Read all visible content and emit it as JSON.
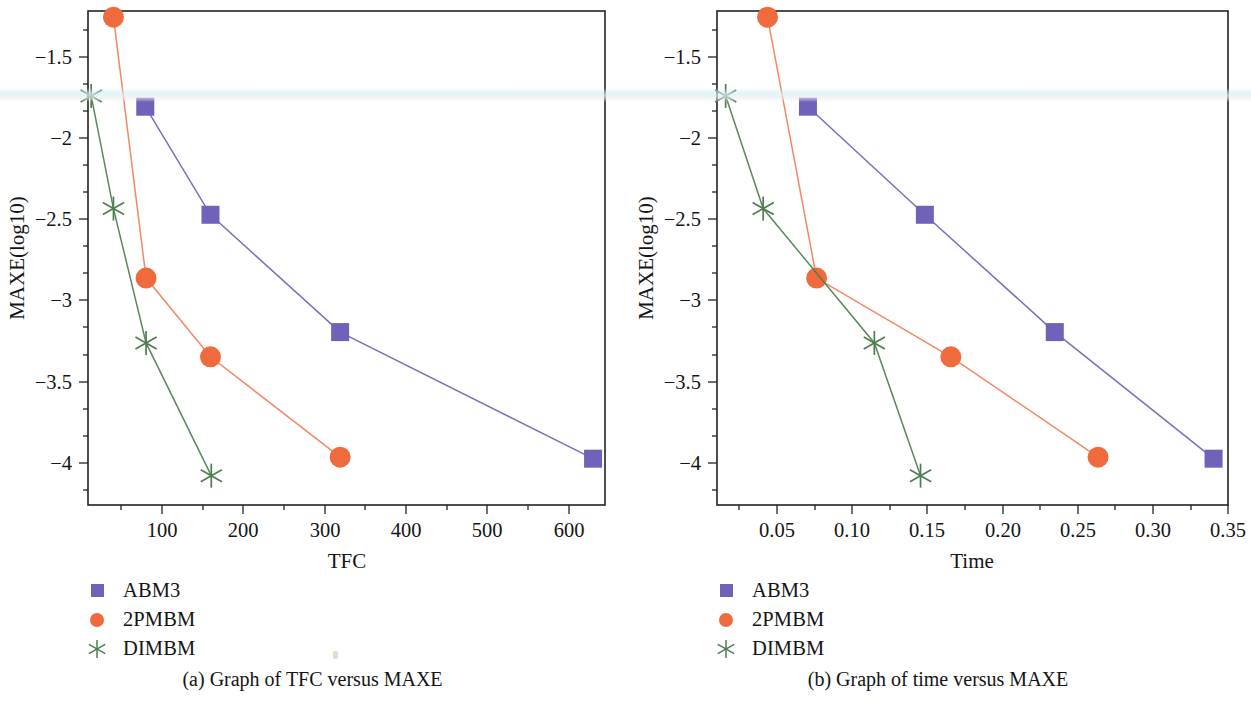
{
  "figure": {
    "panels": [
      {
        "id": "a",
        "caption_index": "(a)",
        "caption_text": "Graph of TFC versus MAXE",
        "xlabel": "TFC",
        "ylabel": "MAXE(log10)",
        "xticks": [
          "100",
          "200",
          "300",
          "400",
          "500",
          "600"
        ],
        "yticks": [
          "−1.5",
          "−2",
          "−2.5",
          "−3",
          "−3.5",
          "−4"
        ],
        "legend": [
          {
            "label": "ABM3",
            "marker": "square-marker",
            "color": "#6f62b8"
          },
          {
            "label": "2PMBM",
            "marker": "circle-marker",
            "color": "#ef6a3c"
          },
          {
            "label": "DIMBM",
            "marker": "star-marker",
            "color": "#4e7d50"
          }
        ]
      },
      {
        "id": "b",
        "caption_index": "(b)",
        "caption_text": "Graph of time versus MAXE",
        "xlabel": "Time",
        "ylabel": "MAXE(log10)",
        "xticks": [
          "0.05",
          "0.10",
          "0.15",
          "0.20",
          "0.25",
          "0.30",
          "0.35"
        ],
        "yticks": [
          "−1.5",
          "−2",
          "−2.5",
          "−3",
          "−3.5",
          "−4"
        ],
        "legend": [
          {
            "label": "ABM3",
            "marker": "square-marker",
            "color": "#6f62b8"
          },
          {
            "label": "2PMBM",
            "marker": "circle-marker",
            "color": "#ef6a3c"
          },
          {
            "label": "DIMBM",
            "marker": "star-marker",
            "color": "#4e7d50"
          }
        ]
      }
    ]
  },
  "chart_data": [
    {
      "type": "line",
      "title": "(a) Graph of TFC versus MAXE",
      "xlabel": "TFC",
      "ylabel": "MAXE(log10)",
      "xlim": [
        10,
        660
      ],
      "ylim": [
        -4.38,
        -1.18
      ],
      "xticks": [
        100,
        200,
        300,
        400,
        500,
        600
      ],
      "yticks": [
        -1.5,
        -2,
        -2.5,
        -3,
        -3.5,
        -4
      ],
      "grid": false,
      "legend_position": "below-left",
      "series": [
        {
          "name": "ABM3",
          "color": "#6f62b8",
          "marker": "square",
          "x": [
            82,
            164,
            327,
            645
          ],
          "y": [
            -1.8,
            -2.5,
            -3.26,
            -4.08
          ]
        },
        {
          "name": "2PMBM",
          "color": "#ef6a3c",
          "marker": "circle",
          "x": [
            42,
            83,
            164,
            327
          ],
          "y": [
            -1.22,
            -2.91,
            -3.42,
            -4.07
          ]
        },
        {
          "name": "DIMBM",
          "color": "#4e7d50",
          "marker": "star",
          "x": [
            14,
            42,
            83,
            165
          ],
          "y": [
            -1.73,
            -2.46,
            -3.33,
            -4.19
          ]
        }
      ]
    },
    {
      "type": "line",
      "title": "(b) Graph of time versus MAXE",
      "xlabel": "Time",
      "ylabel": "MAXE(log10)",
      "xlim": [
        0.008,
        0.362
      ],
      "ylim": [
        -4.38,
        -1.18
      ],
      "xticks": [
        0.05,
        0.1,
        0.15,
        0.2,
        0.25,
        0.3,
        0.35
      ],
      "yticks": [
        -1.5,
        -2,
        -2.5,
        -3,
        -3.5,
        -4
      ],
      "grid": false,
      "legend_position": "below-left",
      "series": [
        {
          "name": "ABM3",
          "color": "#6f62b8",
          "marker": "square",
          "x": [
            0.071,
            0.152,
            0.242,
            0.352
          ],
          "y": [
            -1.8,
            -2.5,
            -3.26,
            -4.08
          ]
        },
        {
          "name": "2PMBM",
          "color": "#ef6a3c",
          "marker": "circle",
          "x": [
            0.043,
            0.077,
            0.17,
            0.272
          ],
          "y": [
            -1.22,
            -2.91,
            -3.42,
            -4.07
          ]
        },
        {
          "name": "DIMBM",
          "color": "#4e7d50",
          "marker": "star",
          "x": [
            0.014,
            0.04,
            0.117,
            0.149
          ],
          "y": [
            -1.73,
            -2.46,
            -3.33,
            -4.19
          ]
        }
      ]
    }
  ]
}
